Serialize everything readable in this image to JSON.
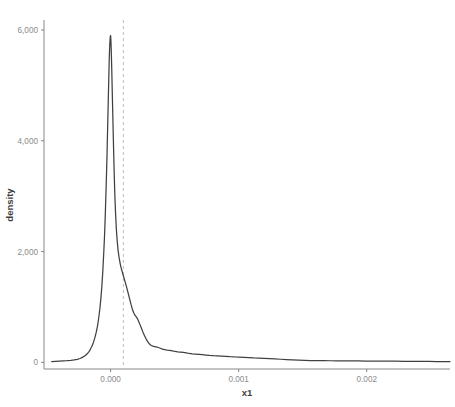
{
  "chart_data": {
    "type": "line",
    "title": "",
    "subtitle": "",
    "xlabel": "x1",
    "ylabel": "density",
    "xlim": [
      -0.00052,
      0.00265
    ],
    "ylim": [
      -120,
      6180
    ],
    "grid": false,
    "legend": null,
    "x_ticks": [
      {
        "value": 0.0,
        "label": "0.000"
      },
      {
        "value": 0.001,
        "label": "0.001"
      },
      {
        "value": 0.002,
        "label": "0.002"
      }
    ],
    "y_ticks": [
      {
        "value": 0,
        "label": "0"
      },
      {
        "value": 2000,
        "label": "2,000"
      },
      {
        "value": 4000,
        "label": "4,000"
      },
      {
        "value": 6000,
        "label": "6,000"
      }
    ],
    "annotations": [
      {
        "type": "vertical-dashed-line",
        "name": "reference-line",
        "x": 0.0001,
        "color": "#c4c4c4",
        "dash": "3 3"
      }
    ],
    "series": [
      {
        "name": "density",
        "color": "#404040",
        "points": [
          [
            -0.00046,
            15
          ],
          [
            -0.00043,
            18
          ],
          [
            -0.0004,
            22
          ],
          [
            -0.00037,
            26
          ],
          [
            -0.00034,
            30
          ],
          [
            -0.00031,
            36
          ],
          [
            -0.000285,
            44
          ],
          [
            -0.00026,
            55
          ],
          [
            -0.00024,
            70
          ],
          [
            -0.00022,
            90
          ],
          [
            -0.0002,
            118
          ],
          [
            -0.000185,
            150
          ],
          [
            -0.00017,
            190
          ],
          [
            -0.000158,
            235
          ],
          [
            -0.000146,
            290
          ],
          [
            -0.000134,
            360
          ],
          [
            -0.000122,
            450
          ],
          [
            -0.000112,
            545
          ],
          [
            -0.000102,
            660
          ],
          [
            -9.3e-05,
            800
          ],
          [
            -8.4e-05,
            965
          ],
          [
            -7.6e-05,
            1150
          ],
          [
            -6.8e-05,
            1380
          ],
          [
            -6.1e-05,
            1640
          ],
          [
            -5.4e-05,
            1950
          ],
          [
            -4.7e-05,
            2300
          ],
          [
            -4.1e-05,
            2700
          ],
          [
            -3.5e-05,
            3150
          ],
          [
            -2.9e-05,
            3650
          ],
          [
            -2.4e-05,
            4150
          ],
          [
            -1.9e-05,
            4650
          ],
          [
            -1.4e-05,
            5150
          ],
          [
            -1e-05,
            5520
          ],
          [
            -6e-06,
            5760
          ],
          [
            -3e-06,
            5870
          ],
          [
            0.0,
            5900
          ],
          [
            2e-06,
            5830
          ],
          [
            5e-06,
            5640
          ],
          [
            9e-06,
            5300
          ],
          [
            1.3e-05,
            4880
          ],
          [
            1.8e-05,
            4380
          ],
          [
            2.3e-05,
            3880
          ],
          [
            2.8e-05,
            3420
          ],
          [
            3.3e-05,
            3020
          ],
          [
            3.9e-05,
            2680
          ],
          [
            4.5e-05,
            2400
          ],
          [
            5.2e-05,
            2180
          ],
          [
            5.9e-05,
            2010
          ],
          [
            6.7e-05,
            1880
          ],
          [
            7.6e-05,
            1770
          ],
          [
            8.5e-05,
            1680
          ],
          [
            9.5e-05,
            1600
          ],
          [
            0.000105,
            1520
          ],
          [
            0.000115,
            1440
          ],
          [
            0.000126,
            1350
          ],
          [
            0.000137,
            1250
          ],
          [
            0.000148,
            1150
          ],
          [
            0.000159,
            1050
          ],
          [
            0.00017,
            960
          ],
          [
            0.000181,
            890
          ],
          [
            0.00019,
            850
          ],
          [
            0.000198,
            830
          ],
          [
            0.000207,
            800
          ],
          [
            0.000217,
            750
          ],
          [
            0.000228,
            690
          ],
          [
            0.00024,
            620
          ],
          [
            0.000252,
            550
          ],
          [
            0.000265,
            480
          ],
          [
            0.000278,
            420
          ],
          [
            0.000291,
            370
          ],
          [
            0.000304,
            330
          ],
          [
            0.000317,
            305
          ],
          [
            0.00033,
            292
          ],
          [
            0.000343,
            285
          ],
          [
            0.000357,
            278
          ],
          [
            0.000372,
            268
          ],
          [
            0.000388,
            255
          ],
          [
            0.000405,
            240
          ],
          [
            0.000423,
            228
          ],
          [
            0.000442,
            222
          ],
          [
            0.000462,
            218
          ],
          [
            0.000482,
            208
          ],
          [
            0.000503,
            196
          ],
          [
            0.000524,
            188
          ],
          [
            0.000546,
            183
          ],
          [
            0.000568,
            178
          ],
          [
            0.000591,
            170
          ],
          [
            0.000614,
            160
          ],
          [
            0.000638,
            152
          ],
          [
            0.000663,
            148
          ],
          [
            0.000689,
            145
          ],
          [
            0.000716,
            140
          ],
          [
            0.000744,
            132
          ],
          [
            0.000773,
            124
          ],
          [
            0.000803,
            120
          ],
          [
            0.000834,
            118
          ],
          [
            0.000866,
            114
          ],
          [
            0.000899,
            108
          ],
          [
            0.000933,
            102
          ],
          [
            0.000968,
            98
          ],
          [
            0.001004,
            96
          ],
          [
            0.001041,
            92
          ],
          [
            0.001079,
            86
          ],
          [
            0.001118,
            80
          ],
          [
            0.001158,
            76
          ],
          [
            0.001199,
            72
          ],
          [
            0.001241,
            68
          ],
          [
            0.001284,
            62
          ],
          [
            0.001328,
            56
          ],
          [
            0.001373,
            50
          ],
          [
            0.001419,
            45
          ],
          [
            0.001466,
            40
          ],
          [
            0.001514,
            36
          ],
          [
            0.001563,
            33
          ],
          [
            0.001613,
            31
          ],
          [
            0.001664,
            30
          ],
          [
            0.001716,
            29
          ],
          [
            0.001769,
            28
          ],
          [
            0.001823,
            27
          ],
          [
            0.001878,
            26
          ],
          [
            0.001934,
            25
          ],
          [
            0.001991,
            24
          ],
          [
            0.002049,
            23
          ],
          [
            0.002108,
            22
          ],
          [
            0.002168,
            21
          ],
          [
            0.002229,
            20
          ],
          [
            0.002291,
            19
          ],
          [
            0.002354,
            18
          ],
          [
            0.002418,
            17
          ],
          [
            0.002483,
            16
          ],
          [
            0.002549,
            15
          ],
          [
            0.002616,
            14
          ],
          [
            0.00265,
            14
          ]
        ]
      }
    ]
  },
  "axis_title_x": "x1",
  "axis_title_y": "density"
}
